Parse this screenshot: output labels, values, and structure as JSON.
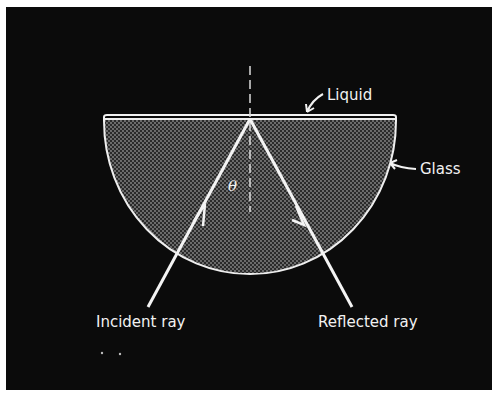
{
  "diagram": {
    "type": "total-internal-reflection-schematic",
    "labels": {
      "liquid": "Liquid",
      "glass": "Glass",
      "incident_ray": "Incident ray",
      "reflected_ray": "Reflected ray",
      "angle": "θ"
    },
    "colors": {
      "background": "#0b0b0b",
      "lines": "#f2f2f2",
      "glass_fill": "#3a3a3a",
      "frame": "#ffffff"
    },
    "elements": [
      "semicircular glass prism with stippled fill",
      "thin liquid layer on the flat top surface",
      "dashed vertical normal at point of incidence",
      "incident ray with arrow pointing toward the interface",
      "reflected ray with arrow pointing away from the interface",
      "angle theta between incident ray and normal"
    ]
  }
}
